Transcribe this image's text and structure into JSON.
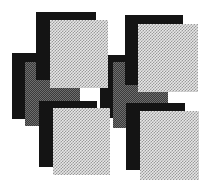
{
  "artwork": {
    "description": "Abstract composition of overlapping halftone rectangles in a 2x2 arrangement",
    "colors": {
      "background": "#ffffff",
      "black": "#141414",
      "dark_dither": "#3a3a3a",
      "light_dither": "#e6e6e6"
    },
    "groups": [
      {
        "name": "top-left",
        "layers": [
          {
            "type": "black",
            "x": 12,
            "y": 53,
            "w": 50,
            "h": 66
          },
          {
            "type": "dark",
            "x": 25,
            "y": 62,
            "w": 55,
            "h": 64
          },
          {
            "type": "black",
            "x": 36,
            "y": 12,
            "w": 60,
            "h": 68
          },
          {
            "type": "light",
            "x": 50,
            "y": 20,
            "w": 58,
            "h": 68
          }
        ]
      },
      {
        "name": "top-right",
        "layers": [
          {
            "type": "black",
            "x": 100,
            "y": 55,
            "w": 50,
            "h": 63
          },
          {
            "type": "dark",
            "x": 113,
            "y": 62,
            "w": 55,
            "h": 66
          },
          {
            "type": "black",
            "x": 125,
            "y": 15,
            "w": 58,
            "h": 70
          },
          {
            "type": "light",
            "x": 138,
            "y": 24,
            "w": 60,
            "h": 68
          }
        ]
      },
      {
        "name": "bottom-left",
        "layers": [
          {
            "type": "black",
            "x": 39,
            "y": 101,
            "w": 58,
            "h": 66
          },
          {
            "type": "light",
            "x": 53,
            "y": 108,
            "w": 57,
            "h": 67
          }
        ]
      },
      {
        "name": "bottom-right",
        "layers": [
          {
            "type": "black",
            "x": 126,
            "y": 103,
            "w": 59,
            "h": 67
          },
          {
            "type": "light",
            "x": 140,
            "y": 111,
            "w": 59,
            "h": 69
          }
        ]
      }
    ]
  }
}
